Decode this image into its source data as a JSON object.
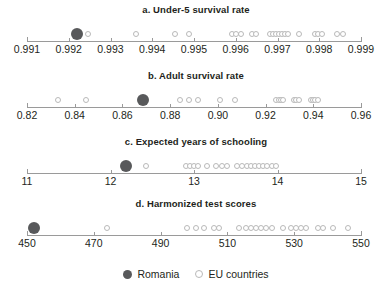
{
  "figure": {
    "legend": {
      "romania_label": "Romania",
      "eu_label": "EU countries",
      "romania_color": "#58595b",
      "eu_color": "#ffffff",
      "eu_border_color": "#b9b9b9"
    }
  },
  "chart_data": [
    {
      "type": "scatter",
      "panel": "a",
      "title": "a. Under-5 survival rate",
      "xlabel": "",
      "ylabel": "",
      "xlim": [
        0.991,
        0.999
      ],
      "ticks": [
        0.991,
        0.992,
        0.993,
        0.994,
        0.995,
        0.996,
        0.997,
        0.998,
        0.999
      ],
      "tick_labels": [
        "0.991",
        "0.992",
        "0.993",
        "0.994",
        "0.995",
        "0.996",
        "0.997",
        "0.998",
        "0.999"
      ],
      "grid": false,
      "legend_position": "bottom",
      "series": [
        {
          "name": "Romania",
          "values": [
            0.9922
          ]
        },
        {
          "name": "EU countries",
          "values": [
            0.99245,
            0.99362,
            0.99455,
            0.99487,
            0.9959,
            0.99601,
            0.99612,
            0.99638,
            0.99649,
            0.99682,
            0.9969,
            0.99697,
            0.99704,
            0.99711,
            0.99718,
            0.99725,
            0.99752,
            0.9979,
            0.99798,
            0.99806,
            0.99842,
            0.99857
          ]
        }
      ]
    },
    {
      "type": "scatter",
      "panel": "b",
      "title": "b. Adult survival rate",
      "xlabel": "",
      "ylabel": "",
      "xlim": [
        0.82,
        0.96
      ],
      "ticks": [
        0.82,
        0.84,
        0.86,
        0.88,
        0.9,
        0.92,
        0.94,
        0.96
      ],
      "tick_labels": [
        "0.82",
        "0.84",
        "0.86",
        "0.88",
        "0.90",
        "0.92",
        "0.94",
        "0.96"
      ],
      "grid": false,
      "legend_position": "bottom",
      "series": [
        {
          "name": "Romania",
          "values": [
            0.8685
          ]
        },
        {
          "name": "EU countries",
          "values": [
            0.8332,
            0.8448,
            0.884,
            0.8878,
            0.8918,
            0.901,
            0.907,
            0.9243,
            0.9258,
            0.9265,
            0.9272,
            0.932,
            0.9327,
            0.934,
            0.9392,
            0.9399,
            0.9406,
            0.942
          ]
        }
      ]
    },
    {
      "type": "scatter",
      "panel": "c",
      "title": "c. Expected years of schooling",
      "xlabel": "",
      "ylabel": "",
      "xlim": [
        11,
        15
      ],
      "ticks": [
        11,
        12,
        13,
        14,
        15
      ],
      "tick_labels": [
        "11",
        "12",
        "13",
        "14",
        "15"
      ],
      "grid": false,
      "legend_position": "bottom",
      "series": [
        {
          "name": "Romania",
          "values": [
            12.18
          ]
        },
        {
          "name": "EU countries",
          "values": [
            12.42,
            12.9,
            12.95,
            13.0,
            13.05,
            13.16,
            13.26,
            13.34,
            13.39,
            13.52,
            13.58,
            13.63,
            13.68,
            13.73,
            13.78,
            13.83,
            13.88,
            13.93,
            13.98
          ]
        }
      ]
    },
    {
      "type": "scatter",
      "panel": "d",
      "title": "d. Harmonized test scores",
      "xlabel": "",
      "ylabel": "",
      "xlim": [
        450,
        550
      ],
      "ticks": [
        450,
        470,
        490,
        510,
        530,
        550
      ],
      "tick_labels": [
        "450",
        "470",
        "490",
        "510",
        "530",
        "550"
      ],
      "grid": false,
      "legend_position": "bottom",
      "series": [
        {
          "name": "Romania",
          "values": [
            452
          ]
        },
        {
          "name": "EU countries",
          "values": [
            474,
            498,
            500.5,
            503,
            506,
            507.5,
            513.5,
            515.5,
            517,
            518.5,
            520,
            521.5,
            523.5,
            526.5,
            529,
            530.5,
            532,
            533.5,
            537,
            538.5,
            541.5,
            546
          ]
        }
      ]
    }
  ]
}
